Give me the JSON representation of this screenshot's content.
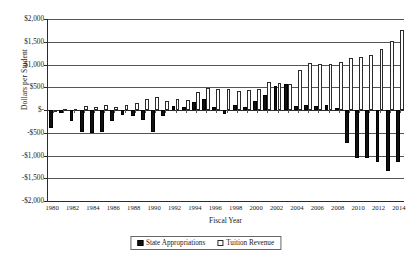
{
  "chart_data": {
    "type": "bar",
    "title": "",
    "xlabel": "Fiscal Year",
    "ylabel": "Dollars per Student",
    "ylim": [
      -2000,
      2000
    ],
    "ytick_labels": [
      "$2,000",
      "$1,500",
      "$1,000",
      "$500",
      "$-",
      "-$500",
      "-$1,000",
      "-$1,500",
      "-$2,000"
    ],
    "ytick_values": [
      2000,
      1500,
      1000,
      500,
      0,
      -500,
      -1000,
      -1500,
      -2000
    ],
    "grid": true,
    "legend_position": "bottom-center",
    "x": [
      1980,
      1981,
      1982,
      1983,
      1984,
      1985,
      1986,
      1987,
      1988,
      1989,
      1990,
      1991,
      1992,
      1993,
      1994,
      1995,
      1996,
      1997,
      1998,
      1999,
      2000,
      2001,
      2002,
      2003,
      2004,
      2005,
      2006,
      2007,
      2008,
      2009,
      2010,
      2011,
      2012,
      2013,
      2014
    ],
    "xtick_labels": [
      "1980",
      "1982",
      "1984",
      "1986",
      "1988",
      "1990",
      "1992",
      "1994",
      "1996",
      "1998",
      "2000",
      "2002",
      "2004",
      "2006",
      "2008",
      "2010",
      "2012",
      "2014"
    ],
    "series": [
      {
        "name": "State Appropriations",
        "color": "#111111",
        "style": "filled",
        "values": [
          -400,
          -60,
          -245,
          -480,
          -500,
          -480,
          -240,
          -100,
          -140,
          -215,
          -480,
          -130,
          90,
          60,
          175,
          250,
          70,
          -95,
          100,
          75,
          190,
          330,
          530,
          580,
          90,
          115,
          95,
          115,
          40,
          -720,
          -1060,
          -1060,
          -1140,
          -1350,
          -1150
        ]
      },
      {
        "name": "Tuition Revenue",
        "color": "#ffffff",
        "style": "hollow",
        "values": [
          -25,
          20,
          25,
          95,
          60,
          100,
          60,
          105,
          160,
          235,
          280,
          200,
          240,
          225,
          400,
          480,
          470,
          460,
          410,
          440,
          465,
          620,
          590,
          580,
          870,
          1030,
          1010,
          1020,
          1060,
          1140,
          1170,
          1200,
          1350,
          1510,
          1750
        ]
      }
    ]
  },
  "legend": {
    "entries": [
      {
        "label": "State Appropriations"
      },
      {
        "label": "Tuition Revenue"
      }
    ]
  }
}
